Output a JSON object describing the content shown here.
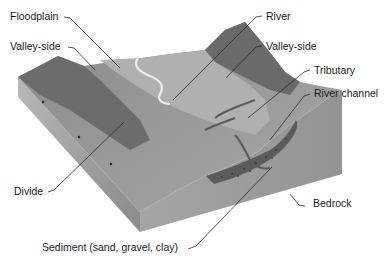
{
  "labels": {
    "floodplain": "Floodplain",
    "valley_side_left": "Valley-side",
    "river": "River",
    "valley_side_right": "Valley-side",
    "tributary": "Tributary",
    "river_channel": "River channel",
    "divide": "Divide",
    "bedrock": "Bedrock",
    "sediment": "Sediment (sand, gravel, clay)"
  },
  "colors": {
    "background": "#ffffff",
    "top_surface": "#9a9a9a",
    "floodplain": "#b3b3b3",
    "valley_side_dark": "#6e6e6e",
    "river": "#e6e6e6",
    "front_face": "#8f8f8f",
    "left_face": "#a9a9a9",
    "sediment": "#5e5e5e",
    "text": "#1a1a1a"
  }
}
